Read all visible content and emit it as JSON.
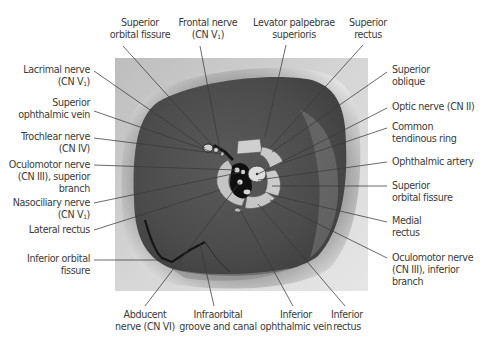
{
  "figure": {
    "colors": {
      "background": "#ffffff",
      "label_text": "#3b3b3b",
      "leader_line": "#3a3a3a",
      "orbit_dark": "#4a4a4a",
      "orbit_rim": "#d8d8d8",
      "photo_bg": "#cfcfcf",
      "ring_tissue": "#c9c9c9",
      "nerve_dark": "#111111"
    }
  },
  "labels": {
    "top": [
      {
        "id": "superior-orbital-fissure-top",
        "lines": [
          "Superior",
          "orbital fissure"
        ]
      },
      {
        "id": "frontal-nerve",
        "lines": [
          "Frontal nerve",
          "(CN V",
          ")"
        ],
        "sub": "1"
      },
      {
        "id": "levator-palpebrae",
        "lines": [
          "Levator palpebrae",
          "superioris"
        ]
      },
      {
        "id": "superior-rectus",
        "lines": [
          "Superior",
          "rectus"
        ]
      }
    ],
    "left": [
      {
        "id": "lacrimal-nerve",
        "lines": [
          "Lacrimal nerve",
          "(CN V",
          ")"
        ],
        "sub": "1"
      },
      {
        "id": "superior-ophthalmic-vein",
        "lines": [
          "Superior",
          "ophthalmic vein"
        ]
      },
      {
        "id": "trochlear-nerve",
        "lines": [
          "Trochlear nerve",
          "(CN IV)"
        ]
      },
      {
        "id": "oculomotor-superior",
        "lines": [
          "Oculomotor nerve",
          "(CN III), superior",
          "branch"
        ]
      },
      {
        "id": "nasociliary-nerve",
        "lines": [
          "Nasociliary nerve",
          "(CN V",
          ")"
        ],
        "sub": "1"
      },
      {
        "id": "lateral-rectus",
        "lines": [
          "Lateral rectus"
        ]
      },
      {
        "id": "inferior-orbital-fissure",
        "lines": [
          "Inferior orbital",
          "fissure"
        ]
      }
    ],
    "right": [
      {
        "id": "superior-oblique",
        "lines": [
          "Superior",
          "oblique"
        ]
      },
      {
        "id": "optic-nerve",
        "lines": [
          "Optic nerve (CN II)"
        ]
      },
      {
        "id": "common-tendinous-ring",
        "lines": [
          "Common",
          "tendinous ring"
        ]
      },
      {
        "id": "ophthalmic-artery",
        "lines": [
          "Ophthalmic artery"
        ]
      },
      {
        "id": "superior-orbital-fissure-right",
        "lines": [
          "Superior",
          "orbital fissure"
        ]
      },
      {
        "id": "medial-rectus",
        "lines": [
          "Medial",
          "rectus"
        ]
      },
      {
        "id": "oculomotor-inferior",
        "lines": [
          "Oculomotor nerve",
          "(CN III), inferior",
          "branch"
        ]
      }
    ],
    "bottom": [
      {
        "id": "abducent-nerve",
        "lines": [
          "Abducent",
          "nerve (CN VI)"
        ]
      },
      {
        "id": "infraorbital-groove",
        "lines": [
          "Infraorbital",
          "groove and canal"
        ]
      },
      {
        "id": "inferior-ophthalmic-vein",
        "lines": [
          "Inferior",
          "ophthalmic vein"
        ]
      },
      {
        "id": "inferior-rectus",
        "lines": [
          "Inferior",
          "rectus"
        ]
      }
    ]
  }
}
